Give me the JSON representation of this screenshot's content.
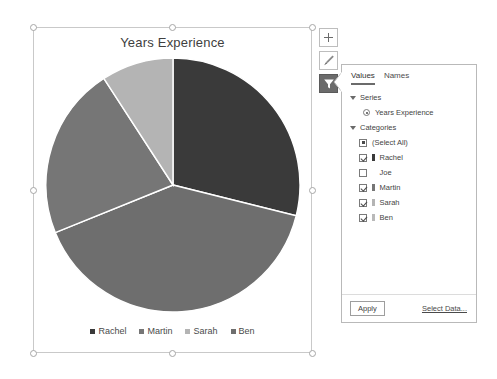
{
  "chart": {
    "title": "Years Experience",
    "selected": true
  },
  "chart_data": {
    "type": "pie",
    "title": "Years Experience",
    "xlabel": "",
    "ylabel": "",
    "legend_position": "bottom",
    "grid": false,
    "categories": [
      "Rachel",
      "Martin",
      "Sarah",
      "Ben"
    ],
    "values": [
      29,
      22,
      9,
      40
    ],
    "units": "years",
    "slices": [
      {
        "label": "Rachel",
        "value": 29,
        "percent": 29,
        "start_angle": 0,
        "end_angle": 104,
        "color": "#3a3a3a"
      },
      {
        "label": "Ben",
        "value": 40,
        "percent": 40,
        "start_angle": 104,
        "end_angle": 248,
        "color": "#6e6e6e"
      },
      {
        "label": "Martin",
        "value": 22,
        "percent": 22,
        "start_angle": 248,
        "end_angle": 327,
        "color": "#767676"
      },
      {
        "label": "Sarah",
        "value": 9,
        "percent": 9,
        "start_angle": 327,
        "end_angle": 360,
        "color": "#b4b4b4"
      }
    ],
    "series_name": "Years Experience"
  },
  "legend": {
    "items": [
      {
        "label": "Rachel",
        "color": "#3a3a3a"
      },
      {
        "label": "Martin",
        "color": "#767676"
      },
      {
        "label": "Sarah",
        "color": "#b4b4b4"
      },
      {
        "label": "Ben",
        "color": "#6e6e6e"
      }
    ]
  },
  "tools": {
    "chart_elements": "chart-elements-plus-icon",
    "chart_styles": "chart-styles-brush-icon",
    "chart_filters": "chart-filters-funnel-icon",
    "active": "chart-filters-funnel-icon"
  },
  "filter_panel": {
    "tabs": [
      {
        "label": "Values",
        "active": true
      },
      {
        "label": "Names",
        "active": false
      }
    ],
    "series_group_label": "Series",
    "series_options": [
      {
        "label": "Years Experience",
        "selected": true
      }
    ],
    "categories_group_label": "Categories",
    "categories": [
      {
        "label": "(Select All)",
        "state": "indeterminate",
        "swatch": null
      },
      {
        "label": "Rachel",
        "state": "checked",
        "swatch": "#3a3a3a"
      },
      {
        "label": "Joe",
        "state": "unchecked",
        "swatch": null
      },
      {
        "label": "Martin",
        "state": "checked",
        "swatch": "#767676"
      },
      {
        "label": "Sarah",
        "state": "checked",
        "swatch": "#b4b4b4"
      },
      {
        "label": "Ben",
        "state": "checked",
        "swatch": "#b9b9b9"
      }
    ],
    "apply_label": "Apply",
    "select_data_label": "Select Data..."
  }
}
